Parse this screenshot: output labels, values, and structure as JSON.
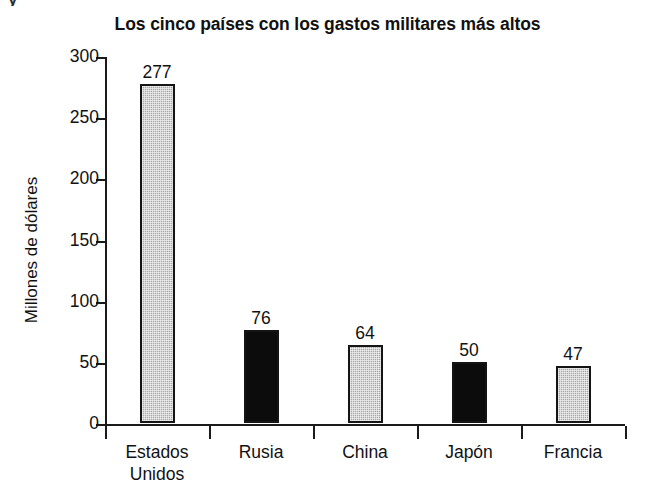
{
  "top_fragment": "y",
  "chart_data": {
    "type": "bar",
    "title": "Los cinco países con los gastos militares más altos",
    "xlabel": "",
    "ylabel": "Millones de dólares",
    "categories": [
      "Estados Unidos",
      "Rusia",
      "China",
      "Japón",
      "Francia"
    ],
    "category_lines": [
      [
        "Estados",
        "Unidos"
      ],
      [
        "Rusia"
      ],
      [
        "China"
      ],
      [
        "Japón"
      ],
      [
        "Francia"
      ]
    ],
    "values": [
      277,
      76,
      64,
      50,
      47
    ],
    "value_labels": [
      "277",
      "76",
      "64",
      "50",
      "47"
    ],
    "bar_colors": [
      "#a8a8a8",
      "#0c0c0c",
      "#a8a8a8",
      "#0c0c0c",
      "#a8a8a8"
    ],
    "bar_styles": [
      "gray",
      "black",
      "gray",
      "black",
      "gray"
    ],
    "ylim": [
      0,
      300
    ],
    "yticks": [
      0,
      50,
      100,
      150,
      200,
      250,
      300
    ],
    "ytick_labels": [
      "0",
      "50",
      "100",
      "150",
      "200",
      "250",
      "300"
    ],
    "grid": false,
    "legend": false
  }
}
